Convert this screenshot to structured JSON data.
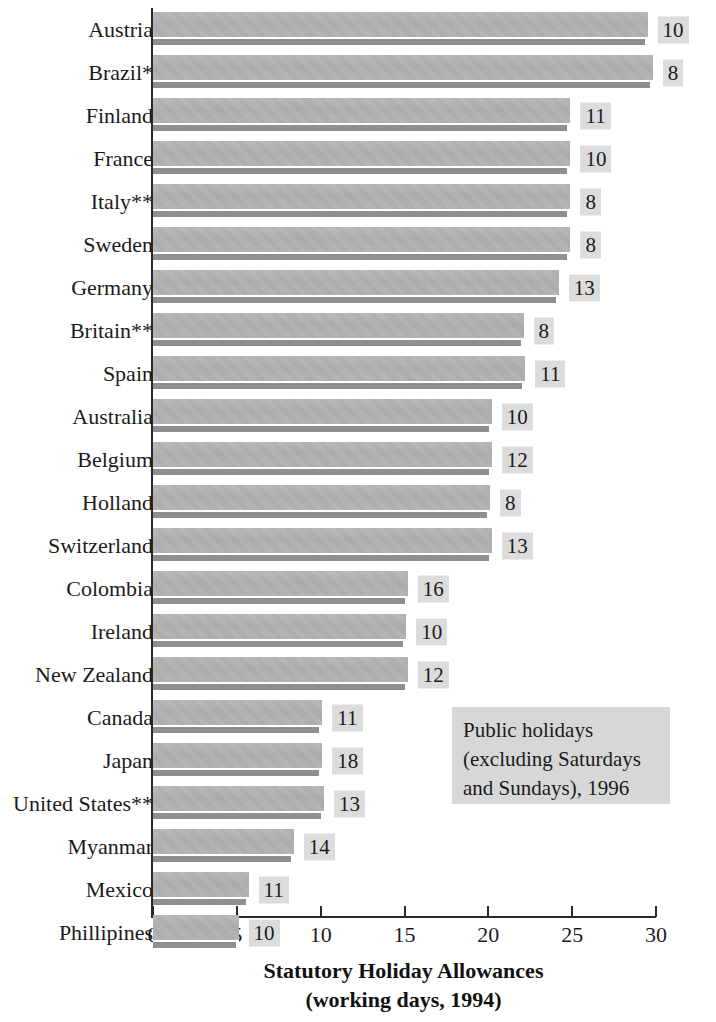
{
  "chart_data": {
    "type": "bar",
    "orientation": "horizontal",
    "title": "Statutory Holiday Allowances",
    "subtitle": "(working days, 1994)",
    "xlabel": "Statutory Holiday Allowances (working days, 1994)",
    "ylabel": "",
    "xlim": [
      0,
      30
    ],
    "grid": false,
    "legend_position": "inside-bottom-right",
    "annotation": {
      "line1": "Public holidays",
      "line2": "(excluding Saturdays",
      "line3": "and Sundays), 1996"
    },
    "footnotes": [
      "*",
      "**"
    ],
    "categories": [
      "Austria",
      "Brazil*",
      "Finland",
      "France",
      "Italy**",
      "Sweden",
      "Germany",
      "Britain**",
      "Spain",
      "Australia",
      "Belgium",
      "Holland",
      "Switzerland",
      "Colombia",
      "Ireland",
      "New Zealand",
      "Canada",
      "Japan",
      "United States**",
      "Myanmar",
      "Mexico",
      "Phillipines"
    ],
    "values": [
      29.5,
      29.8,
      24.9,
      24.9,
      24.9,
      24.9,
      24.2,
      22.1,
      22.2,
      20.2,
      20.2,
      20.1,
      20.2,
      15.2,
      15.1,
      15.2,
      10.1,
      10.1,
      10.2,
      8.4,
      5.7,
      5.1
    ],
    "value_labels": [
      "10",
      "8",
      "11",
      "10",
      "8",
      "8",
      "13",
      "8",
      "11",
      "10",
      "12",
      "8",
      "13",
      "16",
      "10",
      "12",
      "11",
      "18",
      "13",
      "14",
      "11",
      "10"
    ],
    "value_label_series_name": "Public holidays (excluding Saturdays and Sundays), 1996",
    "bar_series_name": "Statutory holiday allowances (working days, 1994)",
    "xticks": [
      0,
      5,
      10,
      15,
      20,
      25,
      30
    ],
    "xtick_labels": [
      "0",
      "5",
      "10",
      "15",
      "20",
      "25",
      "30"
    ],
    "colors": {
      "bar_fill": "#a8a8a8",
      "bar_shadow": "#8f8f8f",
      "value_box": "#dcdcdc",
      "legend_box": "#d7d7d7",
      "axis": "#2a2a2a",
      "text": "#1b1b1b",
      "background": "#ffffff"
    }
  }
}
